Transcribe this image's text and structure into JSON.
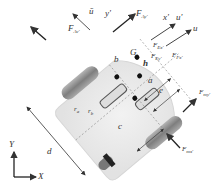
{
  "diagram": {
    "title": "",
    "colors": {
      "body_fill": "#e8e8e8",
      "body_edge": "#cfcfcf",
      "wheel": "#8a8a8a",
      "arrow": "#333333",
      "dashed": "#888888",
      "background": "#ffffff"
    },
    "labels": {
      "u_bar": "ū",
      "y_prime": "y'",
      "F_Av": "F",
      "F_Av_sub": "Av'",
      "F_Ay": "F",
      "F_Ay_sub": "Ay'",
      "x_prime": "x'",
      "u_prime": "u'",
      "u": "u",
      "F_Ex": "F",
      "F_Ex_sub": "Ex'",
      "F_Ey": "F",
      "F_Ey_sub": "Ey'",
      "F_Fx": "F",
      "F_Fx_sub": "Fx'",
      "G": "G",
      "h": "h",
      "b": "b",
      "a": "a",
      "e": "e",
      "c": "c",
      "d": "d",
      "r_a": "r",
      "r_a_sub": "a",
      "r_b": "r",
      "r_b_sub": "b",
      "F_my": "F",
      "F_my_sub": "my'",
      "F_mx": "F",
      "F_mx_sub": "mx'",
      "axis_Y": "Y",
      "axis_X": "X"
    },
    "nodes": [
      "G",
      "h",
      "wheel-left-front",
      "wheel-right-rear",
      "rear-caster",
      "center-joint"
    ]
  }
}
